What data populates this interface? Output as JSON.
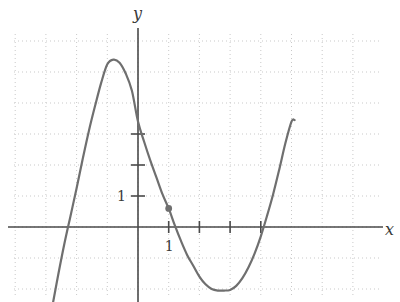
{
  "chart_data": {
    "type": "line",
    "title": "",
    "xlabel": "x",
    "ylabel": "y",
    "grid": true,
    "legend": false,
    "xlim": [
      -4.0,
      8.5
    ],
    "ylim": [
      -2.45,
      6.3
    ],
    "axis_origin_px": [
      138,
      227
    ],
    "unit_px": [
      30.7,
      31.0
    ],
    "x_ticks": [
      1,
      2,
      3,
      4
    ],
    "x_tick_labels": [
      "1",
      "",
      "",
      ""
    ],
    "y_ticks": [
      1,
      2,
      3
    ],
    "y_tick_labels": [
      "1",
      "",
      ""
    ],
    "gridline_step": 1,
    "curve": {
      "name": "cubic",
      "color": "#6f6f6f",
      "points": [
        [
          -2.77,
          -2.45
        ],
        [
          -2.6,
          -1.55
        ],
        [
          -2.4,
          -0.55
        ],
        [
          -2.2,
          0.35
        ],
        [
          -2.0,
          1.25
        ],
        [
          -1.8,
          2.2
        ],
        [
          -1.6,
          3.1
        ],
        [
          -1.4,
          3.9
        ],
        [
          -1.2,
          4.65
        ],
        [
          -1.0,
          5.25
        ],
        [
          -0.8,
          5.4
        ],
        [
          -0.6,
          5.3
        ],
        [
          -0.4,
          4.95
        ],
        [
          -0.2,
          4.4
        ],
        [
          0.0,
          3.4
        ],
        [
          0.2,
          2.75
        ],
        [
          0.4,
          2.15
        ],
        [
          0.6,
          1.6
        ],
        [
          0.8,
          1.05
        ],
        [
          1.0,
          0.6
        ],
        [
          1.2,
          0.05
        ],
        [
          1.4,
          -0.45
        ],
        [
          1.6,
          -0.9
        ],
        [
          1.8,
          -1.25
        ],
        [
          2.0,
          -1.6
        ],
        [
          2.2,
          -1.85
        ],
        [
          2.4,
          -2.0
        ],
        [
          2.6,
          -2.05
        ],
        [
          2.8,
          -2.05
        ],
        [
          3.0,
          -2.03
        ],
        [
          3.2,
          -1.9
        ],
        [
          3.4,
          -1.65
        ],
        [
          3.6,
          -1.3
        ],
        [
          3.8,
          -0.85
        ],
        [
          4.0,
          -0.3
        ],
        [
          4.2,
          0.35
        ],
        [
          4.4,
          1.05
        ],
        [
          4.6,
          1.85
        ],
        [
          4.8,
          2.7
        ],
        [
          5.0,
          3.4
        ],
        [
          5.1,
          3.45
        ]
      ],
      "local_max": [
        -0.8,
        5.4
      ],
      "local_min": [
        2.8,
        -2.05
      ],
      "y_intercept": 3.4
    },
    "marked_point": {
      "x": 1,
      "y": 0.6,
      "label": "",
      "color": "#6f6f6f",
      "radius_px": 3.4
    },
    "colors": {
      "curve": "#6f6f6f",
      "axis": "#4a4a4a",
      "grid": "#c9c9c9",
      "text": "#3a3a3a",
      "background": "#ffffff"
    }
  },
  "labels": {
    "y_axis": "y",
    "x_axis": "x",
    "y_unit": "1",
    "x_unit": "1"
  }
}
